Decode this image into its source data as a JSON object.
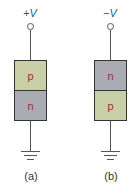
{
  "diagrams": [
    {
      "voltage_label": "+V",
      "regions": [
        {
          "label": "p",
          "type": "p",
          "color": "#c9cfa6"
        },
        {
          "label": "n",
          "type": "n",
          "color": "#a9adb3"
        }
      ],
      "caption": "(a)"
    },
    {
      "voltage_label": "−V",
      "regions": [
        {
          "label": "n",
          "type": "n",
          "color": "#a9adb3"
        },
        {
          "label": "p",
          "type": "p",
          "color": "#c9cfa6"
        }
      ],
      "caption": "(b)"
    }
  ]
}
